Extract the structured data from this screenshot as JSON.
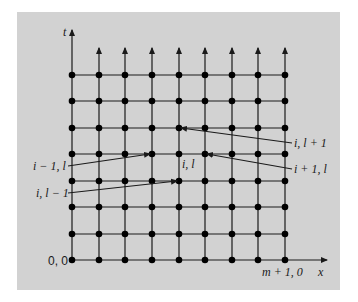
{
  "diagram": {
    "type": "finite-difference grid",
    "axes": {
      "vertical": "t",
      "horizontal": "x"
    },
    "grid": {
      "columns_x": [
        72,
        99,
        125,
        152,
        179,
        205,
        232,
        258,
        285
      ],
      "rows_y": [
        75,
        101,
        128,
        154,
        181,
        207,
        234,
        260
      ],
      "arrow_tip_y": 48,
      "t_axis_top": 30,
      "x_axis_right": 327
    },
    "colors": {
      "panel": "#d2d2d2",
      "line": "#1a1a1a",
      "node": "#000000"
    },
    "labels": {
      "origin": "0, 0",
      "corner": "m + 1, 0",
      "t_axis": "t",
      "x_axis": "x",
      "center": "i, l",
      "up": "i, l + 1",
      "right": "i + 1, l",
      "left": "i − 1, l",
      "down": "i, l − 1"
    },
    "pointers": [
      {
        "label": "i, l + 1",
        "from": [
          292,
          143
        ],
        "to": [
          181,
          128
        ]
      },
      {
        "label": "i + 1, l",
        "from": [
          292,
          169
        ],
        "to": [
          207,
          154
        ]
      },
      {
        "label": "i − 1, l",
        "from": [
          68,
          166
        ],
        "to": [
          150,
          154
        ]
      },
      {
        "label": "i, l − 1",
        "from": [
          68,
          193
        ],
        "to": [
          177,
          181
        ]
      }
    ]
  }
}
